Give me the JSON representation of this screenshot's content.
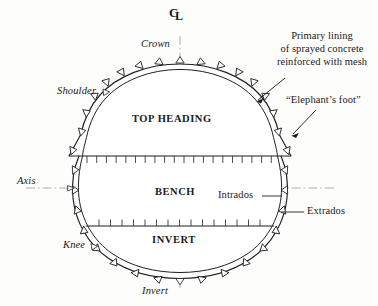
{
  "figure": {
    "type": "tunnel-cross-section-diagram"
  },
  "centerline": {
    "symbol_c": "C",
    "symbol_l": "L",
    "name": "centre-line-symbol"
  },
  "position_labels": {
    "crown": "Crown",
    "shoulder": "Shoulder",
    "axis": "Axis",
    "knee": "Knee",
    "invert": "Invert"
  },
  "stage_labels": {
    "top_heading": "TOP HEADING",
    "bench": "BENCH",
    "invert": "INVERT"
  },
  "annotations": {
    "primary_lining": {
      "line1": "Primary lining",
      "line2": "of sprayed concrete",
      "line3": "reinforced with mesh"
    },
    "elephants_foot": "“Elephant’s foot”",
    "intrados": "Intrados",
    "extrados": "Extrados"
  },
  "colors": {
    "line": "#1f1f1f",
    "centerline": "#8c8c8c",
    "background": "#fdfdfc",
    "text": "#1b1b1b"
  },
  "geometry": {
    "center_x": 180,
    "crown_y": 68,
    "invert_y": 272,
    "left_x": 69,
    "right_x": 291,
    "bench_line_y": 156,
    "invert_line_y": 226,
    "axis_line_y": 188,
    "bench_tick_count": 21,
    "invert_tick_count": 16,
    "bolt_plate_count": 28
  }
}
